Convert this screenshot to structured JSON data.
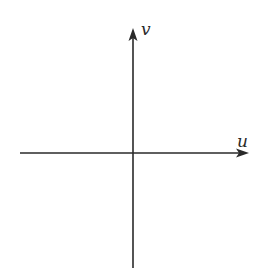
{
  "diagram": {
    "type": "coordinate-axes",
    "axes": {
      "horizontal": {
        "label": "u",
        "direction": "right"
      },
      "vertical": {
        "label": "v",
        "direction": "up"
      }
    },
    "origin": {
      "x": 133,
      "y": 153
    },
    "colors": {
      "axis_stroke": "#2a2a2a",
      "background": "#ffffff"
    }
  }
}
